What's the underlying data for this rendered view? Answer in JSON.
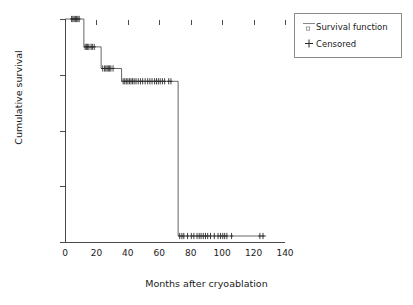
{
  "chart_data": {
    "type": "line",
    "subtype": "kaplan-meier-step",
    "title": "",
    "xlabel": "Months after cryoablation",
    "ylabel": "Cumulative survival",
    "xlim": [
      0,
      140
    ],
    "ylim": [
      0.84,
      1.0
    ],
    "grid": false,
    "xticks": [
      0,
      20,
      40,
      60,
      80,
      100,
      120,
      140
    ],
    "xtick_labels": [
      "0",
      "20",
      "40",
      "60",
      "80",
      "100",
      "120",
      "140"
    ],
    "yticks": [
      0.84,
      0.88,
      0.92,
      0.96,
      1.0
    ],
    "ytick_labels": [
      "0.84",
      "0.88",
      "0.92",
      "0.96",
      "1.00"
    ],
    "legend_position": "top-right",
    "series": [
      {
        "name": "Survival function",
        "marker": "line",
        "steps": [
          {
            "x_start": 0,
            "x_end": 12,
            "y": 1.0
          },
          {
            "x_start": 12,
            "x_end": 23,
            "y": 0.98
          },
          {
            "x_start": 23,
            "x_end": 36,
            "y": 0.9645
          },
          {
            "x_start": 36,
            "x_end": 72,
            "y": 0.9553
          },
          {
            "x_start": 72,
            "x_end": 128,
            "y": 0.8443
          }
        ],
        "event_times": [
          12,
          23,
          36,
          72
        ],
        "x": [
          0,
          12,
          12,
          23,
          23,
          36,
          36,
          72,
          72,
          128
        ],
        "y": [
          1.0,
          1.0,
          0.98,
          0.98,
          0.9645,
          0.9645,
          0.9553,
          0.9553,
          0.8443,
          0.8443
        ]
      },
      {
        "name": "Censored",
        "marker": "+",
        "points": [
          {
            "x": 4.2,
            "y": 1.0
          },
          {
            "x": 5.0,
            "y": 1.0
          },
          {
            "x": 5.8,
            "y": 1.0
          },
          {
            "x": 6.6,
            "y": 1.0
          },
          {
            "x": 7.4,
            "y": 1.0
          },
          {
            "x": 8.2,
            "y": 1.0
          },
          {
            "x": 9.0,
            "y": 1.0
          },
          {
            "x": 12.8,
            "y": 0.98
          },
          {
            "x": 13.6,
            "y": 0.98
          },
          {
            "x": 14.4,
            "y": 0.98
          },
          {
            "x": 15.2,
            "y": 0.98
          },
          {
            "x": 16.6,
            "y": 0.98
          },
          {
            "x": 17.4,
            "y": 0.98
          },
          {
            "x": 18.6,
            "y": 0.98
          },
          {
            "x": 24.0,
            "y": 0.9645
          },
          {
            "x": 25.2,
            "y": 0.9645
          },
          {
            "x": 26.0,
            "y": 0.9645
          },
          {
            "x": 26.8,
            "y": 0.9645
          },
          {
            "x": 27.6,
            "y": 0.9645
          },
          {
            "x": 28.4,
            "y": 0.9645
          },
          {
            "x": 29.2,
            "y": 0.9645
          },
          {
            "x": 30.6,
            "y": 0.9645
          },
          {
            "x": 37.0,
            "y": 0.9553
          },
          {
            "x": 38.0,
            "y": 0.9553
          },
          {
            "x": 39.0,
            "y": 0.9553
          },
          {
            "x": 40.0,
            "y": 0.9553
          },
          {
            "x": 41.0,
            "y": 0.9553
          },
          {
            "x": 42.0,
            "y": 0.9553
          },
          {
            "x": 43.0,
            "y": 0.9553
          },
          {
            "x": 44.0,
            "y": 0.9553
          },
          {
            "x": 45.2,
            "y": 0.9553
          },
          {
            "x": 46.6,
            "y": 0.9553
          },
          {
            "x": 48.0,
            "y": 0.9553
          },
          {
            "x": 49.4,
            "y": 0.9553
          },
          {
            "x": 51.0,
            "y": 0.9553
          },
          {
            "x": 52.6,
            "y": 0.9553
          },
          {
            "x": 54.0,
            "y": 0.9553
          },
          {
            "x": 55.4,
            "y": 0.9553
          },
          {
            "x": 57.0,
            "y": 0.9553
          },
          {
            "x": 58.2,
            "y": 0.9553
          },
          {
            "x": 59.4,
            "y": 0.9553
          },
          {
            "x": 60.6,
            "y": 0.9553
          },
          {
            "x": 62.0,
            "y": 0.9553
          },
          {
            "x": 63.4,
            "y": 0.9553
          },
          {
            "x": 66.0,
            "y": 0.9553
          },
          {
            "x": 67.4,
            "y": 0.9553
          },
          {
            "x": 73.0,
            "y": 0.8443
          },
          {
            "x": 74.4,
            "y": 0.8443
          },
          {
            "x": 75.6,
            "y": 0.8443
          },
          {
            "x": 78.0,
            "y": 0.8443
          },
          {
            "x": 80.4,
            "y": 0.8443
          },
          {
            "x": 82.0,
            "y": 0.8443
          },
          {
            "x": 84.0,
            "y": 0.8443
          },
          {
            "x": 85.4,
            "y": 0.8443
          },
          {
            "x": 86.6,
            "y": 0.8443
          },
          {
            "x": 88.0,
            "y": 0.8443
          },
          {
            "x": 89.4,
            "y": 0.8443
          },
          {
            "x": 90.8,
            "y": 0.8443
          },
          {
            "x": 92.6,
            "y": 0.8443
          },
          {
            "x": 95.0,
            "y": 0.8443
          },
          {
            "x": 97.4,
            "y": 0.8443
          },
          {
            "x": 99.0,
            "y": 0.8443
          },
          {
            "x": 100.4,
            "y": 0.8443
          },
          {
            "x": 101.6,
            "y": 0.8443
          },
          {
            "x": 103.0,
            "y": 0.8443
          },
          {
            "x": 106.0,
            "y": 0.8443
          },
          {
            "x": 124.0,
            "y": 0.8443
          },
          {
            "x": 126.0,
            "y": 0.8443
          }
        ]
      }
    ]
  },
  "axes": {
    "xlabel": "Months after cryoablation",
    "ylabel": "Cumulative survival",
    "xtick_labels": [
      "0",
      "20",
      "40",
      "60",
      "80",
      "100",
      "120",
      "140"
    ],
    "ytick_labels": [
      "0.84",
      "0.88",
      "0.92",
      "0.96",
      "1.00"
    ]
  },
  "legend": {
    "items": [
      {
        "label": "Survival function",
        "marker": "line-with-square"
      },
      {
        "label": "Censored",
        "marker": "plus"
      }
    ]
  },
  "colors": {
    "line": "#555555",
    "axis": "#4a4a4a",
    "text": "#1a1a1a",
    "background": "#ffffff",
    "legend_border": "#8a8a8a"
  }
}
